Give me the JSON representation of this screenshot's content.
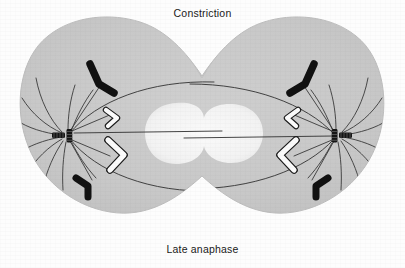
{
  "figure": {
    "title_top": "Constriction",
    "title_bottom": "Late anaphase",
    "colors": {
      "background": "#fdfdfd",
      "cytoplasm": "#c9c9c9",
      "cytoplasm_edge": "#bdbdbd",
      "nuclear_region": "#f4f4f4",
      "chromosome_dark": "#111111",
      "chromosome_light": "#fbfbfb",
      "chromosome_outline": "#1a1a1a",
      "microtubule": "#3a3a3a",
      "centriole": "#151515"
    },
    "stage_name": "Late anaphase",
    "structures": [
      {
        "name": "cell-membrane",
        "label": "Cell membrane (dumbbell, constricting)"
      },
      {
        "name": "constriction-furrow",
        "label": "Constriction"
      },
      {
        "name": "nuclear-region",
        "label": "Clear central region"
      },
      {
        "name": "centrosome-left",
        "label": "Left spindle pole (centriole pair)"
      },
      {
        "name": "centrosome-right",
        "label": "Right spindle pole (centriole pair)"
      },
      {
        "name": "aster-left",
        "label": "Left astral microtubules"
      },
      {
        "name": "aster-right",
        "label": "Right astral microtubules"
      },
      {
        "name": "polar-microtubules",
        "label": "Overlapping polar microtubules"
      },
      {
        "name": "kinetochore-microtubules",
        "label": "Kinetochore microtubules"
      }
    ],
    "chromosomes": [
      {
        "id": "dark-upper-left",
        "shade": "dark",
        "pole": "left",
        "position": "upper"
      },
      {
        "id": "dark-lower-left",
        "shade": "dark",
        "pole": "left",
        "position": "lower"
      },
      {
        "id": "light-upper-left",
        "shade": "light",
        "pole": "left",
        "position": "upper-inner"
      },
      {
        "id": "light-lower-left",
        "shade": "light",
        "pole": "left",
        "position": "lower-inner"
      },
      {
        "id": "dark-upper-right",
        "shade": "dark",
        "pole": "right",
        "position": "upper"
      },
      {
        "id": "dark-lower-right",
        "shade": "dark",
        "pole": "right",
        "position": "lower"
      },
      {
        "id": "light-upper-right",
        "shade": "light",
        "pole": "right",
        "position": "upper-inner"
      },
      {
        "id": "light-lower-right",
        "shade": "light",
        "pole": "right",
        "position": "lower-inner"
      }
    ]
  }
}
